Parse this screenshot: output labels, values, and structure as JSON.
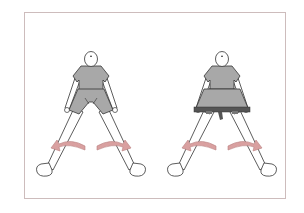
{
  "illustration": {
    "description": "Two seated figures with legs spread wide, curved arrows indicating leg movement; second figure wears a resistance band around the thighs",
    "figures": [
      {
        "label": "without-band",
        "center_x": 91,
        "arrow_color": "#d9a0a0"
      },
      {
        "label": "with-resistance-band",
        "center_x": 222,
        "arrow_color": "#d9a0a0",
        "band_color": "#555555"
      }
    ],
    "colors": {
      "frame_border": "#cdbcbc",
      "clothing": "#a8a8a8",
      "outline": "#333333",
      "arrow_fill": "#d9a0a0",
      "arrow_stroke": "#b88080"
    }
  }
}
